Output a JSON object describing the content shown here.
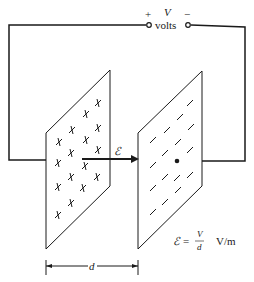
{
  "battery": {
    "plus_sign": "+",
    "minus_sign": "−",
    "voltage_symbol": "V",
    "units_label": "volts"
  },
  "field": {
    "symbol": "ℰ"
  },
  "separation": {
    "symbol": "d"
  },
  "formula": {
    "lhs": "ℰ",
    "equals": "=",
    "numerator": "V",
    "denominator": "d",
    "units": "V/m"
  },
  "plates": {
    "positive_charge_symbol": "+",
    "negative_charge_symbol": "−",
    "positive_count": 16,
    "negative_count": 16
  },
  "colors": {
    "ink": "#1a1a1a",
    "background": "#ffffff"
  }
}
